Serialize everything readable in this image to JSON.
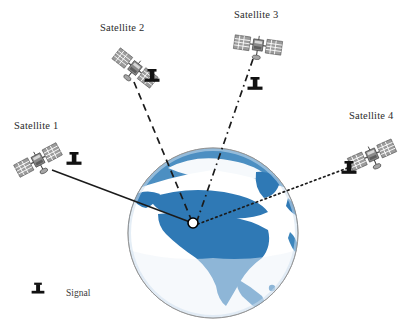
{
  "diagram": {
    "background_color": "#ffffff",
    "globe": {
      "name": "earth-globe",
      "center_x": 213,
      "center_y": 233,
      "radius": 85,
      "ocean_color": "#ffffff",
      "land_color": "#2f79b5",
      "land_color_light": "#8dbade",
      "outline_color": "#8a8a8a",
      "region_shown": "North America"
    },
    "receiver": {
      "name": "gps-receiver-point",
      "x": 193,
      "y": 223,
      "radius": 5,
      "fill": "#ffffff",
      "stroke": "#000000"
    },
    "satellites": [
      {
        "id": "satellite-1",
        "label": "Satellite 1",
        "label_x": 14,
        "label_y": 120,
        "icon_x": 38,
        "icon_y": 160,
        "icon_rotation": -28,
        "signal_icon_x": 74,
        "signal_icon_y": 163,
        "line_style": "solid",
        "line_color": "#1b1b1b",
        "line_from_x": 52,
        "line_from_y": 170,
        "line_to_x": 190,
        "line_to_y": 222
      },
      {
        "id": "satellite-2",
        "label": "Satellite 2",
        "label_x": 100,
        "label_y": 22,
        "icon_x": 135,
        "icon_y": 68,
        "icon_rotation": 38,
        "signal_icon_x": 152,
        "signal_icon_y": 80,
        "line_style": "dashed",
        "line_color": "#1b1b1b",
        "line_from_x": 134,
        "line_from_y": 82,
        "line_to_x": 191,
        "line_to_y": 219
      },
      {
        "id": "satellite-3",
        "label": "Satellite 3",
        "label_x": 234,
        "label_y": 9,
        "icon_x": 258,
        "icon_y": 45,
        "icon_rotation": 8,
        "signal_icon_x": 255,
        "signal_icon_y": 88,
        "line_style": "dashdot",
        "line_color": "#1b1b1b",
        "line_from_x": 253,
        "line_from_y": 59,
        "line_to_x": 197,
        "line_to_y": 221
      },
      {
        "id": "satellite-4",
        "label": "Satellite 4",
        "label_x": 349,
        "label_y": 110,
        "icon_x": 372,
        "icon_y": 155,
        "icon_rotation": -24,
        "signal_icon_x": 349,
        "signal_icon_y": 172,
        "line_style": "dotted",
        "line_color": "#1b1b1b",
        "line_from_x": 361,
        "line_from_y": 163,
        "line_to_x": 198,
        "line_to_y": 224
      }
    ],
    "legend": {
      "name": "signal-legend",
      "icon_x": 38,
      "icon_y": 292,
      "label": "Signal",
      "label_x": 66,
      "label_y": 288
    }
  }
}
